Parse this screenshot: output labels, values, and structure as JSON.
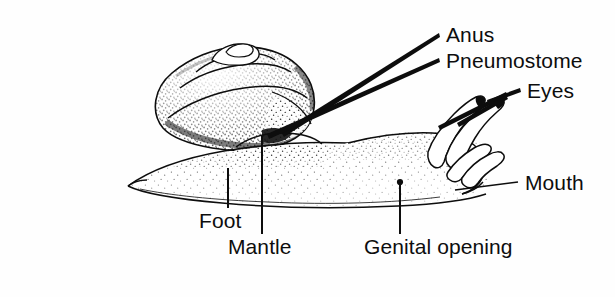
{
  "figure": {
    "style": "black-and-white stippled line drawing",
    "background_color": "#fefefe",
    "ink_color": "#0d0d0d"
  },
  "labels": {
    "anus": "Anus",
    "pneumostome": "Pneumostome",
    "eyes": "Eyes",
    "mouth": "Mouth",
    "foot": "Foot",
    "mantle": "Mantle",
    "genital_opening": "Genital opening"
  },
  "label_positions": {
    "anus": {
      "x": 446,
      "y": 42
    },
    "pneumostome": {
      "x": 446,
      "y": 68
    },
    "eyes": {
      "x": 527,
      "y": 98
    },
    "mouth": {
      "x": 525,
      "y": 190
    },
    "foot": {
      "x": 199,
      "y": 228
    },
    "mantle": {
      "x": 228,
      "y": 254
    },
    "genital_opening": {
      "x": 364,
      "y": 254
    }
  },
  "parts": [
    {
      "name": "shell",
      "description": "coiled spiral shell with stippled shading"
    },
    {
      "name": "foot",
      "description": "muscular stippled foot along the ventral body"
    },
    {
      "name": "mantle",
      "description": "mantle collar beneath the shell aperture"
    },
    {
      "name": "pneumostome",
      "description": "breathing pore on the right mantle edge"
    },
    {
      "name": "anus",
      "description": "opening adjacent to the pneumostome"
    },
    {
      "name": "eyes",
      "description": "eye spots at the tips of the upper tentacles"
    },
    {
      "name": "tentacles",
      "description": "two long ocular tentacles and two short sensory tentacles"
    },
    {
      "name": "mouth",
      "description": "mouth at the front underside of the head"
    },
    {
      "name": "genital_opening",
      "description": "pore on the right side of the body behind the head"
    }
  ]
}
